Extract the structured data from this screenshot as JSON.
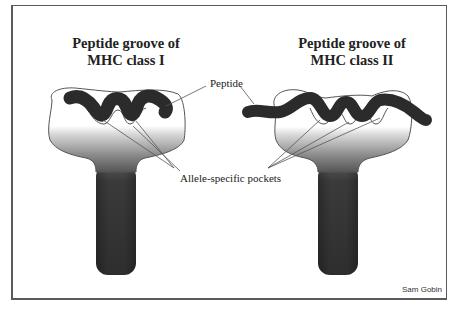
{
  "figure": {
    "panels": [
      {
        "id": "mhc-class-1",
        "title_line1": "Peptide groove of",
        "title_line2": "MHC class I"
      },
      {
        "id": "mhc-class-2",
        "title_line1": "Peptide groove of",
        "title_line2": "MHC class II"
      }
    ],
    "labels": {
      "peptide": "Peptide",
      "pockets": "Allele-specific pockets"
    },
    "credit": "Sam Gobin",
    "colors": {
      "peptide": "#2b2b2b",
      "outline": "#555555",
      "stem_dark": "#333333",
      "frame": "#5a5a5a"
    }
  }
}
